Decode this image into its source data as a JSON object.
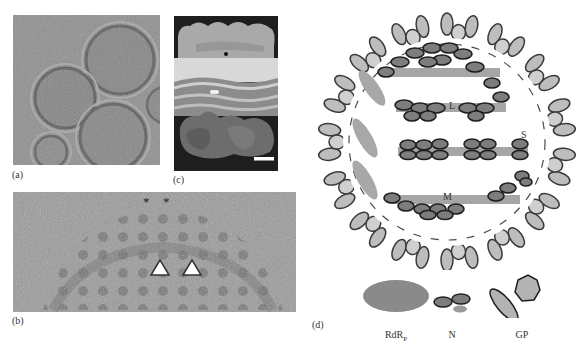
{
  "figure": {
    "panels": [
      {
        "id": "a",
        "label": "(a)",
        "type": "cryo-EM micrograph",
        "content": "spherical virions with textured interior"
      },
      {
        "id": "b",
        "label": "(b)",
        "type": "cryo-EM close-up",
        "markers": {
          "asterisks": [
            "*",
            "*"
          ],
          "arrowheads": 2
        }
      },
      {
        "id": "c",
        "label": "(c)",
        "type": "3D surface reconstruction",
        "scale_bar": true
      },
      {
        "id": "d",
        "label": "(d)",
        "type": "schematic virion",
        "segments": [
          "L",
          "S",
          "M"
        ],
        "legend": [
          {
            "key": "rdrp",
            "label_main": "RdR",
            "label_sub": "P"
          },
          {
            "key": "n",
            "label_main": "N",
            "label_sub": ""
          },
          {
            "key": "gp",
            "label_main": "GP",
            "label_sub": ""
          }
        ]
      }
    ],
    "colors": {
      "envelope_fill": "#bdbdbd",
      "envelope_stroke": "#3a3a3a",
      "rnp_dark": "#7d7d7d",
      "rnp_light": "#a6a6a6",
      "rdrp": "#8a8a8a",
      "gp_fill": "#b3b3b3",
      "micrograph_bg": "#8e8e8e"
    }
  }
}
